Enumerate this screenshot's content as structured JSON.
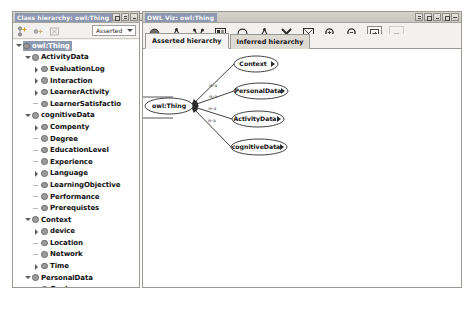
{
  "app": {
    "name": "Protege OWL Viz"
  },
  "left_panel": {
    "title": "Class hierarchy: owl:Thing",
    "window_buttons": [
      {
        "name": "detach-button",
        "glyph": "grid"
      },
      {
        "name": "float-button",
        "glyph": "bar"
      },
      {
        "name": "minimize-button",
        "glyph": "min"
      },
      {
        "name": "maximize-button",
        "glyph": "max"
      },
      {
        "name": "close-button",
        "glyph": "close"
      }
    ],
    "toolbar": {
      "icons": [
        {
          "name": "add-subclass-icon",
          "title": "Add subclass"
        },
        {
          "name": "add-sibling-class-icon",
          "title": "Add sibling class"
        },
        {
          "name": "delete-class-icon",
          "title": "Delete class"
        }
      ],
      "reasoner_select": {
        "value": "Asserted",
        "options": [
          "Asserted",
          "Inferred"
        ]
      }
    },
    "tree": [
      {
        "label": "owl:Thing",
        "depth": 0,
        "state": "expanded",
        "selected": true
      },
      {
        "label": "ActivityData",
        "depth": 1,
        "state": "expanded",
        "selected": false
      },
      {
        "label": "EvaluationLog",
        "depth": 2,
        "state": "collapsed",
        "selected": false
      },
      {
        "label": "Interaction",
        "depth": 2,
        "state": "collapsed",
        "selected": false
      },
      {
        "label": "LearnerActivity",
        "depth": 2,
        "state": "collapsed",
        "selected": false
      },
      {
        "label": "LearnerSatisfactio",
        "depth": 2,
        "state": "leaf",
        "selected": false
      },
      {
        "label": "cognitiveData",
        "depth": 1,
        "state": "expanded",
        "selected": false
      },
      {
        "label": "Compenty",
        "depth": 2,
        "state": "collapsed",
        "selected": false
      },
      {
        "label": "Degree",
        "depth": 2,
        "state": "leaf",
        "selected": false
      },
      {
        "label": "EducationLevel",
        "depth": 2,
        "state": "leaf",
        "selected": false
      },
      {
        "label": "Experience",
        "depth": 2,
        "state": "leaf",
        "selected": false
      },
      {
        "label": "Language",
        "depth": 2,
        "state": "collapsed",
        "selected": false
      },
      {
        "label": "LearningObjective",
        "depth": 2,
        "state": "leaf",
        "selected": false
      },
      {
        "label": "Performance",
        "depth": 2,
        "state": "leaf",
        "selected": false
      },
      {
        "label": "Prerequistes",
        "depth": 2,
        "state": "leaf",
        "selected": false
      },
      {
        "label": "Context",
        "depth": 1,
        "state": "expanded",
        "selected": false
      },
      {
        "label": "device",
        "depth": 2,
        "state": "collapsed",
        "selected": false
      },
      {
        "label": "Location",
        "depth": 2,
        "state": "leaf",
        "selected": false
      },
      {
        "label": "Network",
        "depth": 2,
        "state": "leaf",
        "selected": false
      },
      {
        "label": "Time",
        "depth": 2,
        "state": "collapsed",
        "selected": false
      },
      {
        "label": "PersonalData",
        "depth": 1,
        "state": "expanded",
        "selected": false
      },
      {
        "label": "Goal",
        "depth": 2,
        "state": "leaf",
        "selected": false
      },
      {
        "label": "Identification",
        "depth": 2,
        "state": "leaf",
        "selected": false
      },
      {
        "label": "Interest",
        "depth": 2,
        "state": "leaf",
        "selected": false
      },
      {
        "label": "LearningStyle",
        "depth": 2,
        "state": "leaf",
        "selected": false
      },
      {
        "label": "Motivation",
        "depth": 2,
        "state": "leaf",
        "selected": false
      },
      {
        "label": "Preference",
        "depth": 2,
        "state": "leaf",
        "selected": false
      }
    ]
  },
  "right_panel": {
    "title": "OWL Viz: owl:Thing",
    "window_buttons": [
      {
        "name": "detach-button",
        "glyph": "bar"
      },
      {
        "name": "float-button",
        "glyph": "grid"
      },
      {
        "name": "minimize-button",
        "glyph": "min"
      },
      {
        "name": "maximize-button",
        "glyph": "max"
      },
      {
        "name": "close-button",
        "glyph": "close"
      }
    ],
    "toolbar": [
      {
        "name": "show-node-icon",
        "title": "Show node"
      },
      {
        "name": "show-subclasses-icon",
        "title": "Show subclasses"
      },
      {
        "name": "show-superclasses-icon",
        "title": "Show superclasses"
      },
      {
        "name": "show-grid-icon",
        "title": "Show all classes"
      },
      {
        "name": "hide-node-icon",
        "title": "Hide node"
      },
      {
        "name": "hide-subclasses-icon",
        "title": "Hide subclasses"
      },
      {
        "name": "prune-icon",
        "title": "Prune"
      },
      {
        "name": "radial-layout-icon",
        "title": "Radial layout"
      },
      {
        "name": "zoom-in-icon",
        "title": "Zoom in"
      },
      {
        "name": "zoom-out-icon",
        "title": "Zoom out"
      },
      {
        "name": "export-icon",
        "title": "Export as image"
      },
      {
        "name": "options-icon",
        "title": "Options",
        "disabled": true
      }
    ],
    "tabs": [
      {
        "label": "Asserted hierarchy",
        "active": true
      },
      {
        "label": "Inferred hierarchy",
        "active": false
      }
    ],
    "graph": {
      "root": {
        "label": "owl:Thing",
        "x": 26,
        "y": 57,
        "rx": 24,
        "ry": 8
      },
      "nodes": [
        {
          "label": "Context",
          "x": 113,
          "y": 15,
          "rx": 22,
          "ry": 8
        },
        {
          "label": "PersonalData",
          "x": 118,
          "y": 42,
          "rx": 27,
          "ry": 8
        },
        {
          "label": "ActivityData",
          "x": 115,
          "y": 70,
          "rx": 26,
          "ry": 8
        },
        {
          "label": "cognitiveData",
          "x": 116,
          "y": 98,
          "rx": 28,
          "ry": 8
        }
      ],
      "edges": [
        {
          "from": "owl:Thing",
          "to": "Context",
          "label": "is-a"
        },
        {
          "from": "owl:Thing",
          "to": "PersonalData",
          "label": "is-a"
        },
        {
          "from": "owl:Thing",
          "to": "ActivityData",
          "label": "is-a"
        },
        {
          "from": "owl:Thing",
          "to": "cognitiveData",
          "label": "is-a"
        }
      ]
    }
  },
  "colors": {
    "title_accent": "#8d98b0",
    "panel_bg": "#f2f1ef",
    "canvas_bg": "#ffffff",
    "node_stroke": "#2b2b2b",
    "selection": "#8e98ae"
  }
}
